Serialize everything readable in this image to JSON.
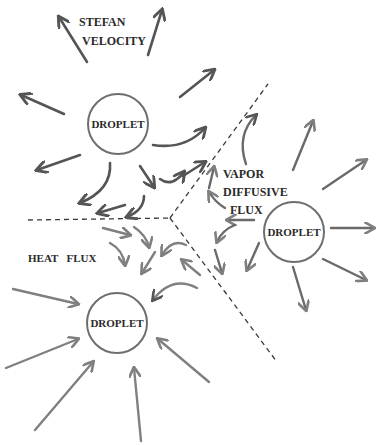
{
  "colors": {
    "background": "#ffffff",
    "dark_arrow": "#555555",
    "light_arrow": "#7f7f7f",
    "circle": "#6e6e6e",
    "text": "#2a2a2a",
    "dashed": "#3a3a3a"
  },
  "labels": {
    "stefan_line1": "STEFAN",
    "stefan_line2": "VELOCITY",
    "vapor_line1": "VAPOR",
    "vapor_line2": "DIFFUSIVE",
    "vapor_line3": "FLUX",
    "heat_flux": "HEAT   FLUX"
  },
  "droplets": [
    {
      "id": "top-left",
      "label": "DROPLET",
      "cx": 118,
      "cy": 124,
      "r": 30
    },
    {
      "id": "right",
      "label": "DROPLET",
      "cx": 294,
      "cy": 232,
      "r": 30
    },
    {
      "id": "bottom-left",
      "label": "DROPLET",
      "cx": 117,
      "cy": 323,
      "r": 30
    }
  ],
  "regions": {
    "stefan_velocity": "top-left droplet, outward dark arrows",
    "vapor_diffusive_flux": "right droplet, outward arrows",
    "heat_flux": "bottom-left droplet, inward light arrows"
  }
}
